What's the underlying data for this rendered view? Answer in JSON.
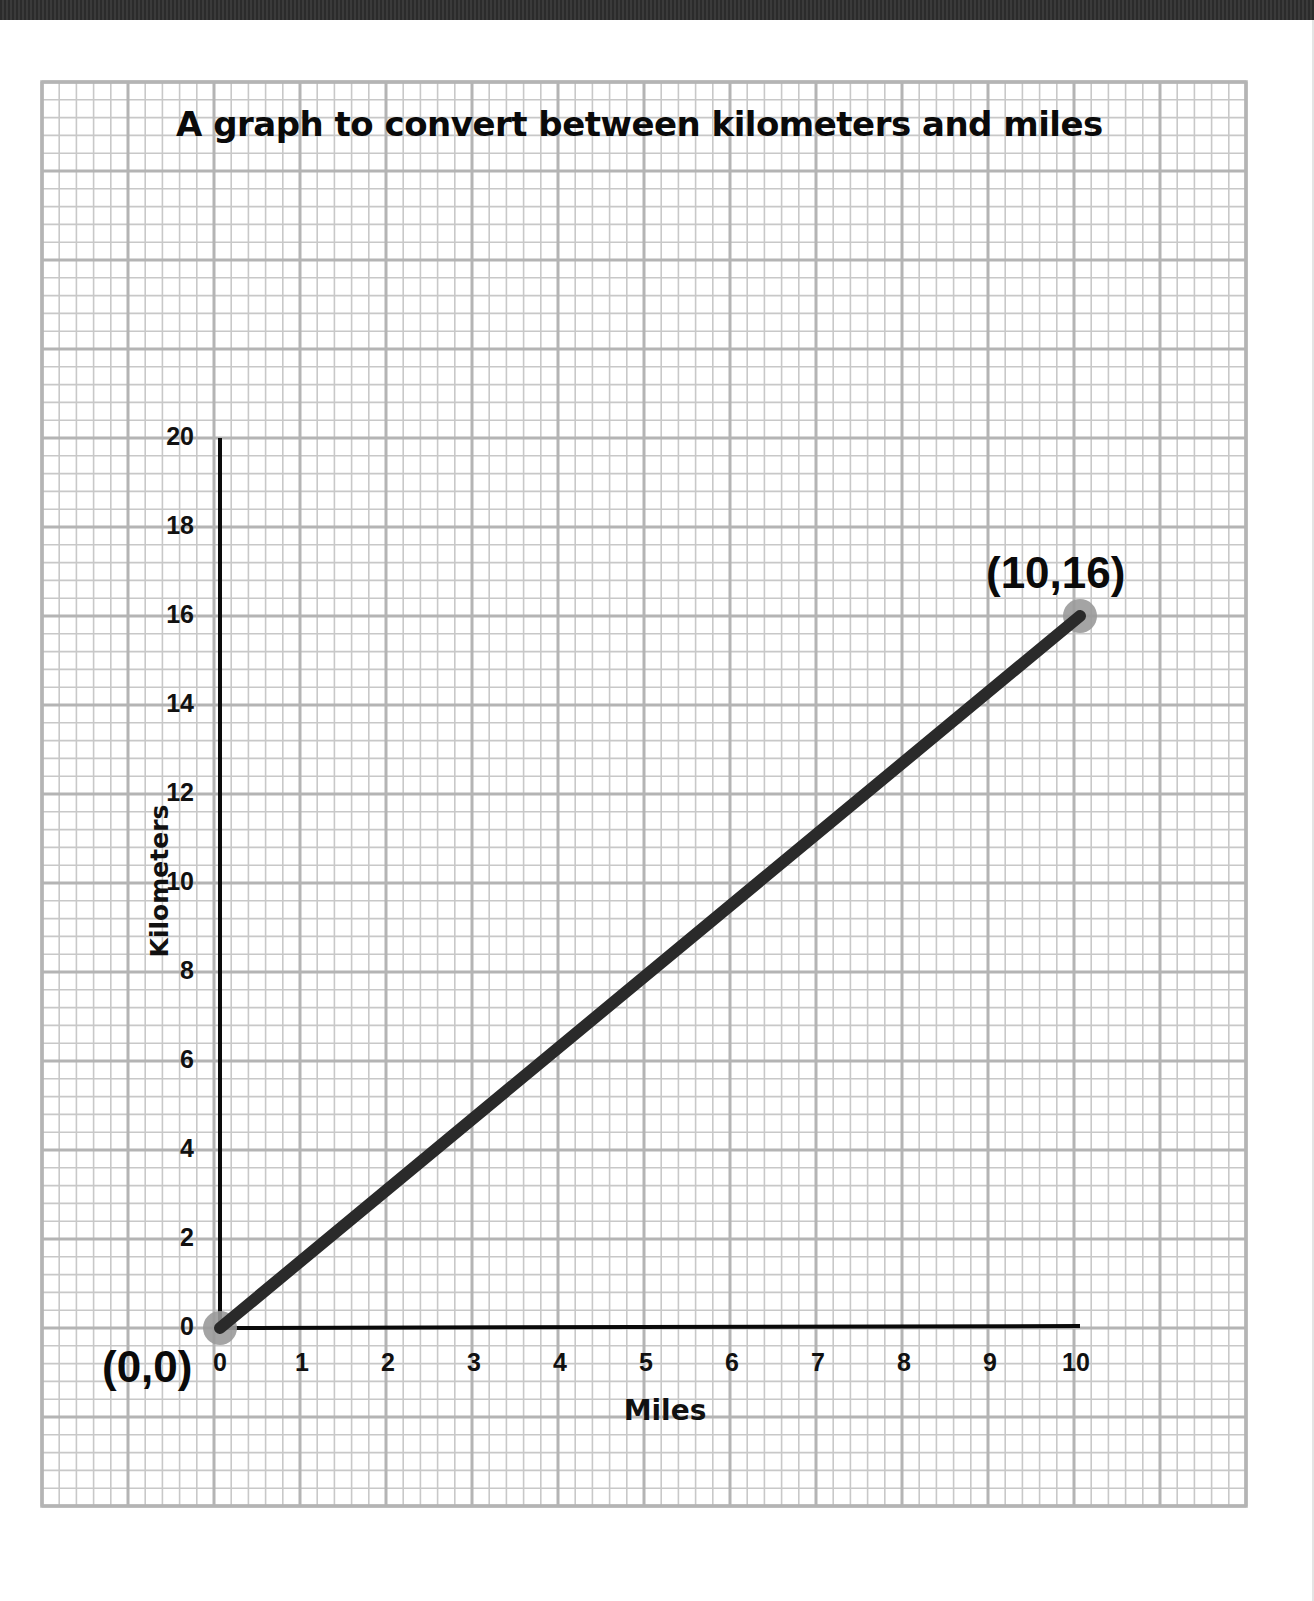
{
  "chart_data": {
    "type": "line",
    "title": "A graph to convert between kilometers and miles",
    "xlabel": "Miles",
    "ylabel": "Kilometers",
    "xlim": [
      0,
      10
    ],
    "ylim": [
      0,
      20
    ],
    "x_ticks": [
      0,
      1,
      2,
      3,
      4,
      5,
      6,
      7,
      8,
      9,
      10
    ],
    "y_ticks": [
      0,
      2,
      4,
      6,
      8,
      10,
      12,
      14,
      16,
      18,
      20
    ],
    "grid": true,
    "series": [
      {
        "name": "Kilometers vs Miles",
        "x": [
          0,
          10
        ],
        "y": [
          0,
          16
        ]
      }
    ],
    "annotations": [
      {
        "text": "(0,0)",
        "x": 0,
        "y": 0
      },
      {
        "text": "(10,16)",
        "x": 10,
        "y": 16
      }
    ]
  },
  "labels": {
    "title": "A graph to convert between kilometers and miles",
    "xlabel": "Miles",
    "ylabel": "Kilometers",
    "x_ticks": [
      "0",
      "1",
      "2",
      "3",
      "4",
      "5",
      "6",
      "7",
      "8",
      "9",
      "10"
    ],
    "y_ticks": [
      "0",
      "2",
      "4",
      "6",
      "8",
      "10",
      "12",
      "14",
      "16",
      "18",
      "20"
    ],
    "point_start": "(0,0)",
    "point_end": "(10,16)"
  },
  "colors": {
    "line": "#2a2a2a",
    "marker": "#9a9a9a",
    "grid_minor": "#c8c8c8",
    "grid_major": "#b4b4b4",
    "axis": "#0a0a0a"
  }
}
